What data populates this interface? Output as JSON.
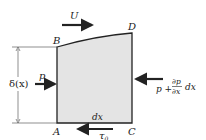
{
  "diagram": {
    "colors": {
      "fill": "#e4e4e4",
      "stroke": "#222222",
      "background": "#ffffff"
    },
    "corners": {
      "A": {
        "label": "A"
      },
      "B": {
        "label": "B"
      },
      "C": {
        "label": "C"
      },
      "D": {
        "label": "D"
      }
    },
    "labels": {
      "freestream_velocity": "U",
      "thickness": "δ(x)",
      "left_pressure": "p",
      "right_pressure_p": "p +",
      "right_pressure_num": "∂p",
      "right_pressure_den": "∂x",
      "right_pressure_dx": "dx",
      "width": "dx",
      "wall_shear": "τ",
      "wall_shear_sub": "0"
    }
  }
}
